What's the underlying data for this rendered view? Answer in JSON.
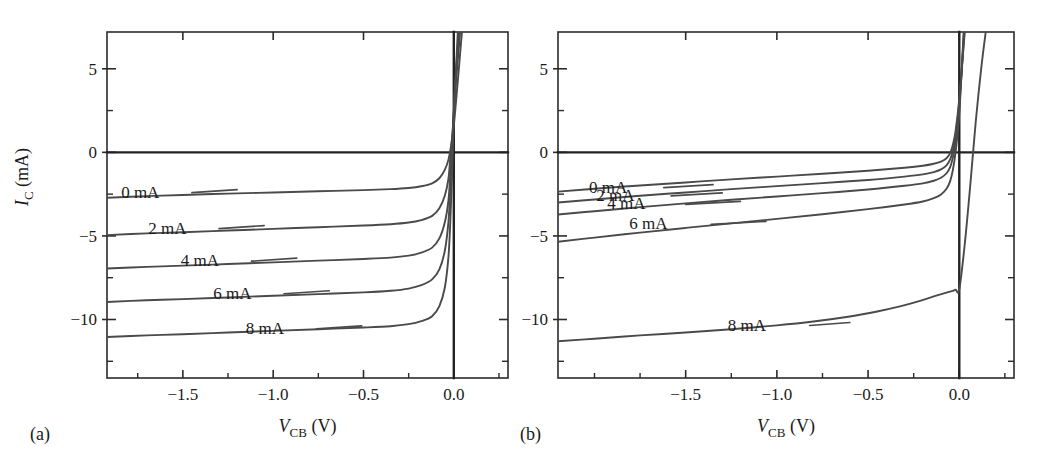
{
  "figure": {
    "title": "",
    "panels": [
      {
        "letter": "(a)",
        "letter_x": 30,
        "letter_y": 440,
        "plot": {
          "x": 107,
          "y": 32,
          "w": 401,
          "h": 346
        },
        "xlabel_main": "V",
        "xlabel_sub": "CB",
        "xlabel_unit": "(V)",
        "ylabel_main": "I",
        "ylabel_sub": "C",
        "ylabel_unit": "(mA)",
        "show_ylabel": true
      },
      {
        "letter": "(b)",
        "letter_x": 520,
        "letter_y": 440,
        "plot": {
          "x": 558,
          "y": 32,
          "w": 456,
          "h": 346
        },
        "xlabel_main": "V",
        "xlabel_sub": "CB",
        "xlabel_unit": "(V)",
        "ylabel_main": "I",
        "ylabel_sub": "C",
        "ylabel_unit": "(mA)",
        "show_ylabel": false
      }
    ]
  },
  "chart_data": [
    {
      "type": "line",
      "panel": "(a)",
      "title": "",
      "xlabel": "V_CB (V)",
      "ylabel": "I_C (mA)",
      "xlim": [
        -1.92,
        0.3
      ],
      "ylim": [
        -13.5,
        7.2
      ],
      "xticks": [
        -1.5,
        -1.0,
        -0.5,
        0.0
      ],
      "xticklabels": [
        "-1.5",
        "-1.0",
        "-0.5",
        "0.0"
      ],
      "xtick_minor_step": 0.25,
      "yticks": [
        5,
        0,
        -5,
        -10
      ],
      "yticklabels": [
        "5",
        "0",
        "-5",
        "-10"
      ],
      "ytick_minor_step": 2.5,
      "grid": false,
      "zero_axis_h": 0,
      "zero_axis_v": 0,
      "legend": "inline-labels",
      "series": [
        {
          "name": "0 mA",
          "plateau": -2.35,
          "knee_v": -0.06,
          "label_x": -1.63,
          "label_y": -2.35,
          "leader_from": -1.45,
          "leader_to": -1.2,
          "points": [
            [
              -1.92,
              -2.72
            ],
            [
              -1.7,
              -2.62
            ],
            [
              -1.5,
              -2.55
            ],
            [
              -1.25,
              -2.47
            ],
            [
              -1.0,
              -2.4
            ],
            [
              -0.75,
              -2.33
            ],
            [
              -0.5,
              -2.26
            ],
            [
              -0.35,
              -2.2
            ],
            [
              -0.25,
              -2.13
            ],
            [
              -0.18,
              -2.03
            ],
            [
              -0.12,
              -1.85
            ],
            [
              -0.08,
              -1.55
            ],
            [
              -0.05,
              -1.05
            ],
            [
              -0.03,
              -0.45
            ],
            [
              -0.015,
              0.4
            ],
            [
              0.0,
              1.6
            ],
            [
              0.02,
              4.0
            ],
            [
              0.045,
              7.2
            ]
          ]
        },
        {
          "name": "2 mA",
          "plateau": -4.5,
          "knee_v": -0.06,
          "label_x": -1.48,
          "label_y": -4.5,
          "leader_from": -1.3,
          "leader_to": -1.05,
          "points": [
            [
              -1.92,
              -4.95
            ],
            [
              -1.7,
              -4.85
            ],
            [
              -1.5,
              -4.78
            ],
            [
              -1.25,
              -4.68
            ],
            [
              -1.0,
              -4.58
            ],
            [
              -0.75,
              -4.48
            ],
            [
              -0.5,
              -4.38
            ],
            [
              -0.35,
              -4.3
            ],
            [
              -0.25,
              -4.2
            ],
            [
              -0.18,
              -4.05
            ],
            [
              -0.12,
              -3.8
            ],
            [
              -0.08,
              -3.35
            ],
            [
              -0.05,
              -2.6
            ],
            [
              -0.03,
              -1.6
            ],
            [
              -0.02,
              -0.4
            ],
            [
              -0.005,
              1.5
            ],
            [
              0.012,
              4.2
            ],
            [
              0.035,
              7.2
            ]
          ]
        },
        {
          "name": "4 mA",
          "plateau": -6.45,
          "knee_v": -0.06,
          "label_x": -1.3,
          "label_y": -6.45,
          "leader_from": -1.12,
          "leader_to": -0.87,
          "points": [
            [
              -1.92,
              -6.95
            ],
            [
              -1.7,
              -6.85
            ],
            [
              -1.5,
              -6.78
            ],
            [
              -1.25,
              -6.68
            ],
            [
              -1.0,
              -6.58
            ],
            [
              -0.75,
              -6.48
            ],
            [
              -0.5,
              -6.38
            ],
            [
              -0.35,
              -6.3
            ],
            [
              -0.25,
              -6.18
            ],
            [
              -0.18,
              -6.0
            ],
            [
              -0.12,
              -5.7
            ],
            [
              -0.08,
              -5.15
            ],
            [
              -0.05,
              -4.2
            ],
            [
              -0.03,
              -2.9
            ],
            [
              -0.02,
              -1.4
            ],
            [
              -0.008,
              0.8
            ],
            [
              0.008,
              4.0
            ],
            [
              0.03,
              7.2
            ]
          ]
        },
        {
          "name": "6 mA",
          "plateau": -8.4,
          "knee_v": -0.055,
          "label_x": -1.12,
          "label_y": -8.4,
          "leader_from": -0.94,
          "leader_to": -0.69,
          "points": [
            [
              -1.92,
              -8.95
            ],
            [
              -1.7,
              -8.85
            ],
            [
              -1.5,
              -8.78
            ],
            [
              -1.25,
              -8.68
            ],
            [
              -1.0,
              -8.58
            ],
            [
              -0.75,
              -8.48
            ],
            [
              -0.5,
              -8.38
            ],
            [
              -0.35,
              -8.28
            ],
            [
              -0.25,
              -8.15
            ],
            [
              -0.18,
              -7.95
            ],
            [
              -0.12,
              -7.6
            ],
            [
              -0.08,
              -7.0
            ],
            [
              -0.05,
              -5.9
            ],
            [
              -0.03,
              -4.2
            ],
            [
              -0.02,
              -2.4
            ],
            [
              -0.008,
              0.2
            ],
            [
              0.005,
              3.6
            ],
            [
              0.027,
              7.2
            ]
          ]
        },
        {
          "name": "8 mA",
          "plateau": -10.5,
          "knee_v": -0.05,
          "label_x": -0.94,
          "label_y": -10.5,
          "leader_from": -0.76,
          "leader_to": -0.51,
          "points": [
            [
              -1.92,
              -11.05
            ],
            [
              -1.7,
              -10.95
            ],
            [
              -1.5,
              -10.88
            ],
            [
              -1.25,
              -10.78
            ],
            [
              -1.0,
              -10.68
            ],
            [
              -0.75,
              -10.58
            ],
            [
              -0.5,
              -10.48
            ],
            [
              -0.35,
              -10.4
            ],
            [
              -0.25,
              -10.28
            ],
            [
              -0.18,
              -10.1
            ],
            [
              -0.12,
              -9.8
            ],
            [
              -0.08,
              -9.2
            ],
            [
              -0.05,
              -8.1
            ],
            [
              -0.03,
              -6.3
            ],
            [
              -0.02,
              -4.3
            ],
            [
              -0.01,
              -1.5
            ],
            [
              0.0,
              2.0
            ],
            [
              0.022,
              7.2
            ]
          ]
        }
      ]
    },
    {
      "type": "line",
      "panel": "(b)",
      "title": "",
      "xlabel": "V_CB (V)",
      "ylabel": "I_C (mA)",
      "xlim": [
        -2.2,
        0.3
      ],
      "ylim": [
        -13.5,
        7.2
      ],
      "xticks": [
        -1.5,
        -1.0,
        -0.5,
        0.0
      ],
      "xticklabels": [
        "-1.5",
        "-1.0",
        "-0.5",
        "0.0"
      ],
      "xtick_minor_step": 0.25,
      "yticks": [
        5,
        0,
        -5,
        -10
      ],
      "yticklabels": [
        "5",
        "0",
        "-5",
        "-10"
      ],
      "ytick_minor_step": 2.5,
      "grid": false,
      "zero_axis_h": 0,
      "zero_axis_v": 0,
      "legend": "inline-labels",
      "series": [
        {
          "name": "0 mA",
          "plateau": -1.15,
          "knee_v": -0.07,
          "label_x": -1.82,
          "label_y": -2.05,
          "leader_from": -1.62,
          "leader_to": -1.35,
          "points": [
            [
              -2.2,
              -2.35
            ],
            [
              -2.0,
              -2.18
            ],
            [
              -1.75,
              -1.98
            ],
            [
              -1.5,
              -1.8
            ],
            [
              -1.25,
              -1.62
            ],
            [
              -1.0,
              -1.45
            ],
            [
              -0.75,
              -1.28
            ],
            [
              -0.5,
              -1.1
            ],
            [
              -0.3,
              -0.92
            ],
            [
              -0.2,
              -0.8
            ],
            [
              -0.14,
              -0.68
            ],
            [
              -0.1,
              -0.55
            ],
            [
              -0.07,
              -0.35
            ],
            [
              -0.05,
              -0.05
            ],
            [
              -0.035,
              0.45
            ],
            [
              -0.02,
              1.3
            ],
            [
              0.0,
              3.2
            ],
            [
              0.03,
              7.2
            ]
          ]
        },
        {
          "name": "2 mA",
          "plateau": -1.6,
          "knee_v": -0.07,
          "label_x": -1.78,
          "label_y": -2.55,
          "leader_from": -1.58,
          "leader_to": -1.3,
          "points": [
            [
              -2.2,
              -3.0
            ],
            [
              -2.0,
              -2.82
            ],
            [
              -1.75,
              -2.6
            ],
            [
              -1.5,
              -2.4
            ],
            [
              -1.25,
              -2.2
            ],
            [
              -1.0,
              -2.02
            ],
            [
              -0.75,
              -1.84
            ],
            [
              -0.5,
              -1.65
            ],
            [
              -0.3,
              -1.45
            ],
            [
              -0.2,
              -1.32
            ],
            [
              -0.14,
              -1.18
            ],
            [
              -0.1,
              -1.02
            ],
            [
              -0.07,
              -0.78
            ],
            [
              -0.05,
              -0.42
            ],
            [
              -0.035,
              0.1
            ],
            [
              -0.02,
              1.0
            ],
            [
              0.0,
              3.0
            ],
            [
              0.028,
              7.2
            ]
          ]
        },
        {
          "name": "4 mA",
          "plateau": -2.1,
          "knee_v": -0.07,
          "label_x": -1.72,
          "label_y": -3.05,
          "leader_from": -1.5,
          "leader_to": -1.2,
          "points": [
            [
              -2.2,
              -3.72
            ],
            [
              -2.0,
              -3.52
            ],
            [
              -1.75,
              -3.28
            ],
            [
              -1.5,
              -3.05
            ],
            [
              -1.25,
              -2.84
            ],
            [
              -1.0,
              -2.64
            ],
            [
              -0.75,
              -2.44
            ],
            [
              -0.5,
              -2.22
            ],
            [
              -0.3,
              -2.0
            ],
            [
              -0.2,
              -1.86
            ],
            [
              -0.14,
              -1.7
            ],
            [
              -0.1,
              -1.52
            ],
            [
              -0.07,
              -1.25
            ],
            [
              -0.05,
              -0.88
            ],
            [
              -0.035,
              -0.3
            ],
            [
              -0.02,
              0.65
            ],
            [
              0.0,
              2.7
            ],
            [
              0.026,
              7.2
            ]
          ]
        },
        {
          "name": "6 mA",
          "plateau": -3.1,
          "knee_v": -0.065,
          "label_x": -1.6,
          "label_y": -4.25,
          "leader_from": -1.36,
          "leader_to": -1.06,
          "points": [
            [
              -2.2,
              -5.35
            ],
            [
              -2.0,
              -5.1
            ],
            [
              -1.75,
              -4.8
            ],
            [
              -1.5,
              -4.52
            ],
            [
              -1.25,
              -4.25
            ],
            [
              -1.0,
              -3.98
            ],
            [
              -0.75,
              -3.7
            ],
            [
              -0.5,
              -3.4
            ],
            [
              -0.3,
              -3.12
            ],
            [
              -0.2,
              -2.94
            ],
            [
              -0.14,
              -2.74
            ],
            [
              -0.1,
              -2.52
            ],
            [
              -0.07,
              -2.18
            ],
            [
              -0.05,
              -1.72
            ],
            [
              -0.035,
              -1.05
            ],
            [
              -0.02,
              0.05
            ],
            [
              0.0,
              2.3
            ],
            [
              0.024,
              7.2
            ]
          ]
        },
        {
          "name": "8 mA",
          "plateau": -8.4,
          "knee_v": -0.02,
          "label_x": -1.06,
          "label_y": -10.3,
          "leader_from": -0.82,
          "leader_to": -0.6,
          "points": [
            [
              -2.2,
              -11.3
            ],
            [
              -2.0,
              -11.15
            ],
            [
              -1.75,
              -10.95
            ],
            [
              -1.5,
              -10.78
            ],
            [
              -1.25,
              -10.58
            ],
            [
              -1.0,
              -10.35
            ],
            [
              -0.8,
              -10.12
            ],
            [
              -0.6,
              -9.82
            ],
            [
              -0.45,
              -9.52
            ],
            [
              -0.32,
              -9.2
            ],
            [
              -0.22,
              -8.9
            ],
            [
              -0.14,
              -8.62
            ],
            [
              -0.08,
              -8.42
            ],
            [
              -0.04,
              -8.3
            ],
            [
              -0.02,
              -8.22
            ],
            [
              0.0,
              -8.2
            ],
            [
              0.03,
              -5.5
            ],
            [
              0.06,
              -2.0
            ],
            [
              0.09,
              1.8
            ],
            [
              0.12,
              5.0
            ],
            [
              0.145,
              7.2
            ]
          ]
        }
      ]
    }
  ]
}
